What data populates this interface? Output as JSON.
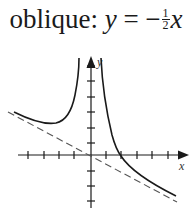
{
  "title": {
    "prefix": "oblique: ",
    "lhs": "y",
    "equals": " = −",
    "frac_num": "1",
    "frac_den": "2",
    "rhs": "x"
  },
  "axes": {
    "x_label": "x",
    "y_label": "y",
    "origin_px": [
      91,
      155
    ],
    "tick_spacing_px": 15.5,
    "x_ticks_left": 4,
    "x_ticks_right": 5,
    "y_ticks_up": 6,
    "y_ticks_down": 3
  },
  "asymptote": {
    "type": "oblique",
    "equation": "y = -1/2 x",
    "style": "dashed"
  },
  "colors": {
    "curve": "#1a1a1a",
    "axis": "#1a1a1a",
    "asymptote": "#555555"
  }
}
